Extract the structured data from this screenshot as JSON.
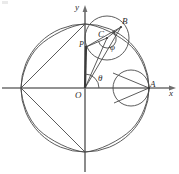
{
  "figure": {
    "kind": "geometry-diagram",
    "background": "#ffffff",
    "stroke_color": "#4a4a4a",
    "axis_color": "#6e6e6e",
    "label_color": "#2b2b2b",
    "width": 179,
    "height": 174
  },
  "axes": {
    "x_label": "x",
    "y_label": "y",
    "origin_label": "O",
    "x_axis": {
      "x1": 2,
      "y1": 88,
      "x2": 176,
      "y2": 88
    },
    "y_axis": {
      "x1": 85,
      "y1": 170,
      "x2": 85,
      "y2": 6
    }
  },
  "big_circle": {
    "cx": 85,
    "cy": 88,
    "r": 64
  },
  "astroid": {
    "cx": 85,
    "cy": 88,
    "a": 64
  },
  "rolling_circle": {
    "cx": 107,
    "cy": 38,
    "r": 22
  },
  "tangent_circle": {
    "cx": 131,
    "cy": 88,
    "r": 18
  },
  "points": [
    {
      "name": "O",
      "label": "O",
      "x": 85,
      "y": 88,
      "label_x": 77,
      "label_y": 91
    },
    {
      "name": "A",
      "label": "A",
      "x": 149,
      "y": 88,
      "label_x": 150,
      "label_y": 81
    },
    {
      "name": "B",
      "label": "B",
      "x": 121,
      "y": 27,
      "label_x": 122,
      "label_y": 18
    },
    {
      "name": "C",
      "label": "C",
      "x": 107,
      "y": 38,
      "label_x": 100,
      "label_y": 33
    },
    {
      "name": "P",
      "label": "P",
      "x": 86,
      "y": 47,
      "label_x": 80,
      "label_y": 43
    }
  ],
  "angles": [
    {
      "name": "theta",
      "label": "θ",
      "at": "O",
      "label_x": 98,
      "label_y": 77
    },
    {
      "name": "phi",
      "label": "φ",
      "at": "C",
      "label_x": 111,
      "label_y": 46
    }
  ],
  "segments": [
    {
      "name": "O-to-C",
      "x1": 85,
      "y1": 88,
      "x2": 107,
      "y2": 38
    },
    {
      "name": "O-to-P",
      "x1": 85,
      "y1": 88,
      "x2": 86,
      "y2": 47
    },
    {
      "name": "C-to-P",
      "x1": 107,
      "y1": 38,
      "x2": 86,
      "y2": 47
    },
    {
      "name": "C-to-B",
      "x1": 107,
      "y1": 38,
      "x2": 121,
      "y2": 27
    },
    {
      "name": "O-to-B",
      "x1": 85,
      "y1": 88,
      "x2": 121,
      "y2": 27
    },
    {
      "name": "P-to-B",
      "x1": 86,
      "y1": 47,
      "x2": 121,
      "y2": 27
    },
    {
      "name": "tangent-chord-upper",
      "x1": 113,
      "y1": 74,
      "x2": 149,
      "y2": 88
    },
    {
      "name": "tangent-chord-lower",
      "x1": 113,
      "y1": 102,
      "x2": 149,
      "y2": 88
    },
    {
      "name": "left-cusp-chord-upper",
      "x1": 21,
      "y1": 88,
      "x2": 85,
      "y2": 24
    },
    {
      "name": "left-cusp-chord-lower",
      "x1": 21,
      "y1": 88,
      "x2": 85,
      "y2": 152
    }
  ],
  "theta_arc": {
    "cx": 85,
    "cy": 88,
    "r": 14,
    "start_deg": 0,
    "end_deg": 88
  },
  "phi_arc": {
    "cx": 107,
    "cy": 38,
    "r": 9
  }
}
